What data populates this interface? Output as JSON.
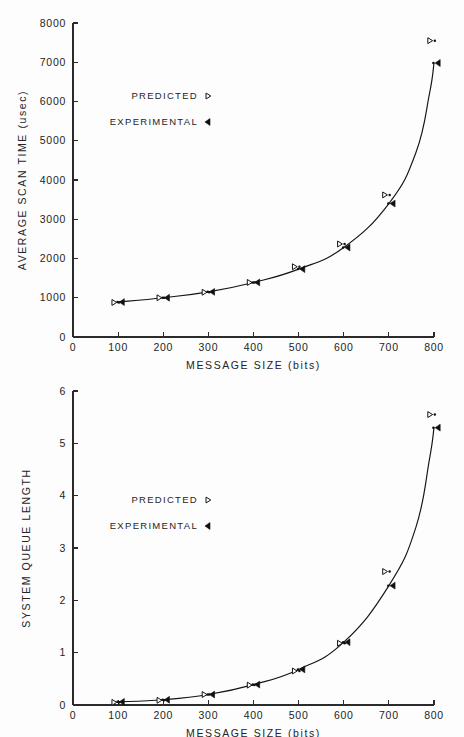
{
  "figure": {
    "background_color": "#fdfdfd",
    "ink_color": "#141414"
  },
  "chart_data": [
    {
      "id": "average-scan-time",
      "type": "scatter",
      "title": "",
      "xlabel": "MESSAGE  SIZE  (bits)",
      "ylabel": "AVERAGE  SCAN TIME  (usec)",
      "xlim": [
        0,
        800
      ],
      "ylim": [
        0,
        8000
      ],
      "xticks": [
        0,
        100,
        200,
        300,
        400,
        500,
        600,
        700,
        800
      ],
      "xticklabels": [
        "0",
        "100",
        "200",
        "300",
        "400",
        "500",
        "600",
        "700",
        "800"
      ],
      "yticks": [
        0,
        1000,
        2000,
        3000,
        4000,
        5000,
        6000,
        7000,
        8000
      ],
      "yticklabels": [
        "0",
        "1000",
        "2000",
        "3000",
        "4000",
        "5000",
        "6000",
        "7000",
        "8000"
      ],
      "grid": false,
      "legend_position": "upper-left-inside",
      "legend": [
        {
          "label": "PREDICTED",
          "marker": "hollow-right-triangle"
        },
        {
          "label": "EXPERIMENTAL",
          "marker": "filled-left-triangle"
        }
      ],
      "x": [
        100,
        200,
        300,
        400,
        500,
        600,
        700,
        800
      ],
      "series": [
        {
          "name": "PREDICTED",
          "marker": "hollow-right-triangle",
          "values": [
            880,
            1000,
            1140,
            1390,
            1790,
            2370,
            3620,
            7550
          ]
        },
        {
          "name": "EXPERIMENTAL",
          "marker": "filled-left-triangle",
          "values": [
            890,
            1000,
            1150,
            1390,
            1730,
            2280,
            3400,
            6980
          ]
        }
      ],
      "curve": {
        "name": "experimental-fit",
        "x": [
          100,
          200,
          300,
          400,
          500,
          600,
          700,
          760,
          790,
          800
        ],
        "y": [
          890,
          1000,
          1150,
          1390,
          1730,
          2280,
          3400,
          4700,
          6200,
          6980
        ]
      }
    },
    {
      "id": "system-queue-length",
      "type": "scatter",
      "title": "",
      "xlabel": "MESSAGE  SIZE  (bits)",
      "ylabel": "SYSTEM  QUEUE  LENGTH",
      "xlim": [
        0,
        800
      ],
      "ylim": [
        0,
        6
      ],
      "xticks": [
        0,
        100,
        200,
        300,
        400,
        500,
        600,
        700,
        800
      ],
      "xticklabels": [
        "0",
        "100",
        "200",
        "300",
        "400",
        "500",
        "600",
        "700",
        "800"
      ],
      "yticks": [
        0,
        1,
        2,
        3,
        4,
        5,
        6
      ],
      "yticklabels": [
        "0",
        "1",
        "2",
        "3",
        "4",
        "5",
        "6"
      ],
      "grid": false,
      "legend_position": "upper-left-inside",
      "legend": [
        {
          "label": "PREDICTED",
          "marker": "hollow-right-triangle"
        },
        {
          "label": "EXPERIMENTAL",
          "marker": "filled-left-triangle"
        }
      ],
      "x": [
        100,
        200,
        300,
        400,
        500,
        600,
        700,
        800
      ],
      "series": [
        {
          "name": "PREDICTED",
          "marker": "hollow-right-triangle",
          "values": [
            0.05,
            0.09,
            0.2,
            0.38,
            0.65,
            1.18,
            2.55,
            5.55
          ]
        },
        {
          "name": "EXPERIMENTAL",
          "marker": "filled-left-triangle",
          "values": [
            0.06,
            0.1,
            0.2,
            0.39,
            0.68,
            1.2,
            2.28,
            5.3
          ]
        }
      ],
      "curve": {
        "name": "experimental-fit",
        "x": [
          100,
          200,
          300,
          400,
          500,
          600,
          700,
          760,
          790,
          800
        ],
        "y": [
          0.06,
          0.1,
          0.2,
          0.39,
          0.68,
          1.2,
          2.28,
          3.4,
          4.7,
          5.3
        ]
      }
    }
  ]
}
